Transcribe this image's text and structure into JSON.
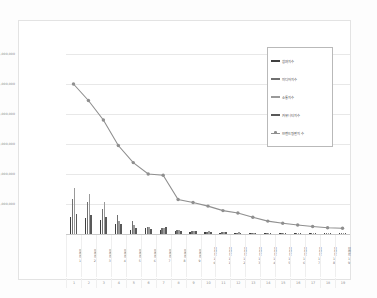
{
  "chart": {
    "type": "bar",
    "background": "#ffffff",
    "frame_border": "#e3e3e3"
  },
  "legend": {
    "position": "top-right",
    "items": [
      {
        "label": "참여지수",
        "color": "#3f3f3f",
        "marker": "bar"
      },
      {
        "label": "미디어지수",
        "color": "#707070",
        "marker": "bar"
      },
      {
        "label": "소통지수",
        "color": "#9a9a9a",
        "marker": "bar"
      },
      {
        "label": "커뮤니티지수",
        "color": "#595959",
        "marker": "bar"
      },
      {
        "label": "브랜드평판지수",
        "color": "#8f8f8f",
        "marker": "line"
      }
    ]
  },
  "yaxis": {
    "ticks": [
      "1,000,000",
      "2,000,000",
      "3,000,000",
      "4,000,000",
      "5,000,000",
      "6,000,000"
    ],
    "min": 0,
    "max": 6000000,
    "grid": true
  },
  "chart_data": {
    "type": "bar",
    "title": "",
    "xlabel": "",
    "ylabel": "",
    "ylim": [
      0,
      6000000
    ],
    "grid": true,
    "legend_position": "top-right",
    "categories": [
      "브랜드1",
      "브랜드2",
      "브랜드3",
      "브랜드4",
      "브랜드5",
      "브랜드6",
      "브랜드7",
      "브랜드8",
      "브랜드9",
      "브랜드10",
      "브랜드11",
      "브랜드12",
      "브랜드13",
      "브랜드14",
      "브랜드15",
      "브랜드16",
      "브랜드17",
      "브랜드18",
      "브랜드19"
    ],
    "ranks": [
      "1",
      "2",
      "3",
      "4",
      "5",
      "6",
      "7",
      "8",
      "9",
      "10",
      "11",
      "12",
      "13",
      "14",
      "15",
      "16",
      "17",
      "18",
      "19"
    ],
    "series": [
      {
        "name": "참여지수",
        "type": "bar",
        "color": "#3f3f3f",
        "values": [
          560000,
          520000,
          470000,
          330000,
          120000,
          190000,
          140000,
          90000,
          70000,
          55000,
          45000,
          40000,
          32000,
          22000,
          18000,
          15000,
          12000,
          10000,
          9000
        ]
      },
      {
        "name": "미디어지수",
        "type": "bar",
        "color": "#707070",
        "values": [
          1180000,
          1060000,
          830000,
          640000,
          420000,
          230000,
          210000,
          120000,
          95000,
          80000,
          60000,
          50000,
          38000,
          28000,
          22000,
          18000,
          15000,
          12000,
          10000
        ]
      },
      {
        "name": "소통지수",
        "type": "bar",
        "color": "#9a9a9a",
        "values": [
          1520000,
          1340000,
          1070000,
          420000,
          300000,
          250000,
          200000,
          130000,
          100000,
          85000,
          65000,
          52000,
          40000,
          30000,
          24000,
          19000,
          16000,
          13000,
          11000
        ]
      },
      {
        "name": "커뮤니티지수",
        "type": "bar",
        "color": "#595959",
        "values": [
          680000,
          620000,
          560000,
          330000,
          210000,
          170000,
          230000,
          110000,
          88000,
          72000,
          58000,
          46000,
          35000,
          26000,
          20000,
          17000,
          14000,
          11000,
          9500
        ]
      },
      {
        "name": "브랜드평판지수",
        "type": "line",
        "color": "#8f8f8f",
        "values": [
          5000000,
          4450000,
          3800000,
          2950000,
          2380000,
          2000000,
          1960000,
          1150000,
          1050000,
          930000,
          780000,
          700000,
          560000,
          430000,
          360000,
          300000,
          250000,
          210000,
          190000
        ]
      }
    ]
  }
}
